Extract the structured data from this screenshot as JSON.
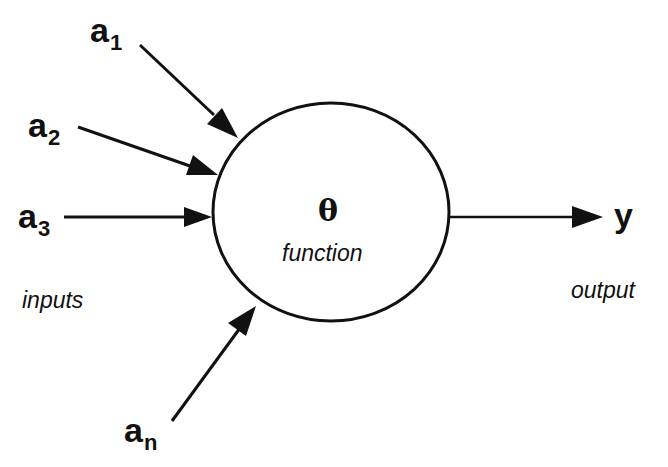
{
  "diagram": {
    "inputs": [
      {
        "base": "a",
        "sub": "1"
      },
      {
        "base": "a",
        "sub": "2"
      },
      {
        "base": "a",
        "sub": "3"
      },
      {
        "base": "a",
        "sub": "n"
      }
    ],
    "inputs_label": "inputs",
    "node": {
      "symbol": "θ",
      "label": "function"
    },
    "output": {
      "symbol": "y",
      "label": "output"
    }
  }
}
